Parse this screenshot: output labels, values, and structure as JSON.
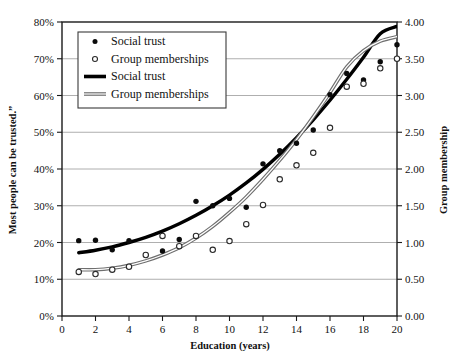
{
  "chart_data": {
    "type": "scatter",
    "title": "",
    "xlabel": "Education (years)",
    "ylabel": "Most  people can be trusted.”",
    "ylabel_right": "Group membership",
    "xlim": [
      0,
      20
    ],
    "ylim": [
      0,
      80
    ],
    "ylim_right": [
      0.0,
      4.0
    ],
    "grid": "horizontal",
    "legend_position": "top-left",
    "xticks": [
      "0",
      "2",
      "4",
      "6",
      "8",
      "10",
      "12",
      "14",
      "16",
      "18",
      "20"
    ],
    "xtick_values": [
      0,
      2,
      4,
      6,
      8,
      10,
      12,
      14,
      16,
      18,
      20
    ],
    "yticks_left": [
      "0%",
      "10%",
      "20%",
      "30%",
      "40%",
      "50%",
      "60%",
      "70%",
      "80%"
    ],
    "ytick_values_left": [
      0,
      10,
      20,
      30,
      40,
      50,
      60,
      70,
      80
    ],
    "yticks_right": [
      "0.00",
      "0.50",
      "1.00",
      "1.50",
      "2.00",
      "2.50",
      "3.00",
      "3.50",
      "4.00"
    ],
    "ytick_values_right": [
      0.0,
      0.5,
      1.0,
      1.5,
      2.0,
      2.5,
      3.0,
      3.5,
      4.0
    ],
    "legend": [
      {
        "label": "Social trust",
        "marker": "filled-circle",
        "type": "marker"
      },
      {
        "label": "Group memberships",
        "marker": "open-circle",
        "type": "marker"
      },
      {
        "label": "Social trust",
        "marker": "thick-black-line",
        "type": "line"
      },
      {
        "label": "Group memberships",
        "marker": "gray-line",
        "type": "line"
      }
    ],
    "series": [
      {
        "name": "Social trust",
        "kind": "scatter",
        "axis": "left",
        "marker": "filled-circle",
        "x": [
          1,
          2,
          3,
          4,
          5,
          6,
          7,
          8,
          9,
          10,
          11,
          12,
          13,
          14,
          15,
          16,
          17,
          18,
          19,
          20
        ],
        "values": [
          20.5,
          20.6,
          18.0,
          20.5,
          16.6,
          17.7,
          20.8,
          31.2,
          30.0,
          32.0,
          29.6,
          41.4,
          45.0,
          47.0,
          50.6,
          60.2,
          66.0,
          64.2,
          69.2,
          73.8
        ]
      },
      {
        "name": "Group memberships",
        "kind": "scatter",
        "axis": "right",
        "marker": "open-circle",
        "x": [
          1,
          2,
          3,
          4,
          5,
          6,
          7,
          8,
          9,
          10,
          11,
          12,
          13,
          14,
          15,
          16,
          17,
          18,
          19,
          20
        ],
        "values": [
          0.6,
          0.57,
          0.63,
          0.67,
          0.83,
          1.09,
          0.95,
          1.09,
          0.9,
          1.02,
          1.25,
          1.51,
          1.86,
          2.05,
          2.22,
          2.56,
          3.12,
          3.16,
          3.37,
          3.5
        ]
      },
      {
        "name": "Social trust",
        "kind": "fit-curve",
        "axis": "left",
        "style": "thick-black-line",
        "x": [
          1,
          2,
          3,
          4,
          5,
          6,
          7,
          8,
          9,
          10,
          11,
          12,
          13,
          14,
          15,
          16,
          17,
          18,
          19,
          20
        ],
        "values": [
          17.2,
          17.9,
          18.8,
          20.0,
          21.4,
          23.1,
          25.1,
          27.4,
          30.0,
          32.9,
          36.2,
          39.9,
          44.0,
          48.5,
          53.4,
          58.7,
          64.4,
          70.4,
          76.8,
          78.8
        ]
      },
      {
        "name": "Group memberships",
        "kind": "fit-curve",
        "axis": "right",
        "style": "gray-line",
        "x": [
          1,
          2,
          3,
          4,
          5,
          6,
          7,
          8,
          9,
          10,
          11,
          12,
          13,
          14,
          15,
          16,
          17,
          18,
          19,
          20
        ],
        "values": [
          0.63,
          0.63,
          0.65,
          0.69,
          0.75,
          0.83,
          0.93,
          1.06,
          1.22,
          1.41,
          1.62,
          1.86,
          2.12,
          2.4,
          2.71,
          3.04,
          3.39,
          3.61,
          3.74,
          3.8
        ]
      }
    ]
  }
}
